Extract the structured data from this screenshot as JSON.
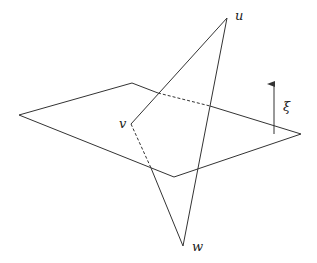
{
  "diagram": {
    "colors": {
      "line": "#333333",
      "background": "#ffffff"
    },
    "plane": {
      "corners": {
        "left": [
          19,
          115
        ],
        "top": [
          132,
          83
        ],
        "right": [
          301,
          134
        ],
        "bottom": [
          174,
          177
        ]
      }
    },
    "triangle": {
      "vertices": {
        "u": {
          "label": "u",
          "pos": [
            227,
            18
          ],
          "label_pos": [
            235,
            9
          ]
        },
        "v": {
          "label": "v",
          "pos": [
            131,
            124
          ],
          "label_pos": [
            119,
            117
          ]
        },
        "w": {
          "label": "w",
          "pos": [
            183,
            246
          ],
          "label_pos": [
            192,
            240
          ]
        }
      }
    },
    "normal_vector": {
      "label": "ξ",
      "from": [
        274,
        134
      ],
      "to": [
        274,
        81
      ],
      "label_pos": [
        283,
        100
      ]
    }
  }
}
